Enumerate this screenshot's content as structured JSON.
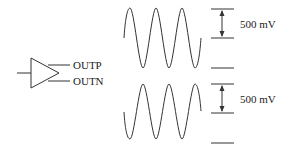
{
  "diagram": {
    "amplifier": {
      "outputs": [
        "OUTP",
        "OUTN"
      ]
    },
    "waveforms": [
      {
        "name": "OUTP",
        "amplitude_label": "500 mV",
        "phase": "non-inverted"
      },
      {
        "name": "OUTN",
        "amplitude_label": "500 mV",
        "phase": "inverted"
      }
    ],
    "colors": {
      "stroke": "#333333",
      "text": "#222222"
    }
  }
}
